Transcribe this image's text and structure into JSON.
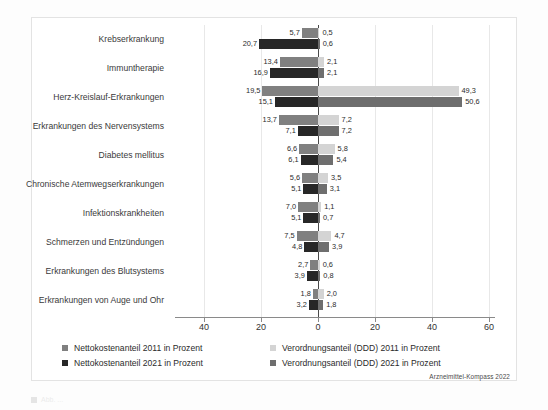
{
  "figure": {
    "source_note": "Arzneimittel-Kompass 2022",
    "caption_partial": "Abb. ..."
  },
  "legend": {
    "items": [
      {
        "label": "Nettokostenanteil 2011 in Prozent",
        "color": "#808080",
        "column": 1
      },
      {
        "label": "Nettokostenanteil 2021 in Prozent",
        "color": "#272727",
        "column": 1
      },
      {
        "label": "Verordnungsanteil (DDD) 2011 in Prozent",
        "color": "#d4d4d4",
        "column": 2
      },
      {
        "label": "Verordnungsanteil (DDD) 2021 in Prozent",
        "color": "#6e6e6e",
        "column": 2
      }
    ]
  },
  "colors": {
    "netto_2011": "#808080",
    "netto_2021": "#272727",
    "ddd_2011": "#d4d4d4",
    "ddd_2021": "#6e6e6e",
    "axis": "#8a8a8a",
    "zero_axis": "#4a4a4a",
    "grid": "#e8e8e8",
    "frame": "#e3e3e3"
  },
  "axis": {
    "ticks": [
      {
        "label": "40",
        "value": -40
      },
      {
        "label": "20",
        "value": -20
      },
      {
        "label": "0",
        "value": 0
      },
      {
        "label": "20",
        "value": 20
      },
      {
        "label": "40",
        "value": 40
      },
      {
        "label": "60",
        "value": 60
      }
    ],
    "left_max": 40,
    "right_max": 60
  },
  "chart_data": {
    "type": "bar",
    "orientation": "horizontal-diverging",
    "title": "",
    "subtitle": "",
    "xlabel": "Prozent",
    "ylabel": "",
    "xlim": [
      -40,
      60
    ],
    "grid": true,
    "legend_position": "bottom",
    "categories": [
      "Krebserkrankung",
      "Immuntherapie",
      "Herz-Kreislauf-Erkrankungen",
      "Erkrankungen des Nervensystems",
      "Diabetes mellitus",
      "Chronische Atemwegserkrankungen",
      "Infektionskrankheiten",
      "Schmerzen und Entzündungen",
      "Erkrankungen des Blutsystems",
      "Erkrankungen von Auge und Ohr"
    ],
    "series": [
      {
        "name": "Nettokostenanteil 2011 in Prozent",
        "side": "left",
        "year": "2011",
        "color": "#808080",
        "values": [
          5.7,
          13.4,
          19.5,
          13.7,
          6.6,
          5.6,
          7.0,
          7.5,
          2.7,
          1.8
        ],
        "labels": [
          "5,7",
          "13,4",
          "19,5",
          "13,7",
          "6,6",
          "5,6",
          "7,0",
          "7,5",
          "2,7",
          "1,8"
        ]
      },
      {
        "name": "Nettokostenanteil 2021 in Prozent",
        "side": "left",
        "year": "2021",
        "color": "#272727",
        "values": [
          20.7,
          16.9,
          15.1,
          7.1,
          6.1,
          5.1,
          5.1,
          4.8,
          3.9,
          3.2
        ],
        "labels": [
          "20,7",
          "16,9",
          "15,1",
          "7,1",
          "6,1",
          "5,1",
          "5,1",
          "4,8",
          "3,9",
          "3,2"
        ]
      },
      {
        "name": "Verordnungsanteil (DDD) 2011 in Prozent",
        "side": "right",
        "year": "2011",
        "color": "#d4d4d4",
        "values": [
          0.5,
          2.1,
          49.3,
          7.2,
          5.8,
          3.5,
          1.1,
          4.7,
          0.6,
          2.0
        ],
        "labels": [
          "0,5",
          "2,1",
          "49,3",
          "7,2",
          "5,8",
          "3,5",
          "1,1",
          "4,7",
          "0,6",
          "2,0"
        ]
      },
      {
        "name": "Verordnungsanteil (DDD) 2021 in Prozent",
        "side": "right",
        "year": "2021",
        "color": "#6e6e6e",
        "values": [
          0.6,
          2.1,
          50.6,
          7.2,
          5.4,
          3.1,
          0.7,
          3.9,
          0.8,
          1.8
        ],
        "labels": [
          "0,6",
          "2,1",
          "50,6",
          "7,2",
          "5,4",
          "3,1",
          "0,7",
          "3,9",
          "0,8",
          "1,8"
        ]
      }
    ]
  }
}
